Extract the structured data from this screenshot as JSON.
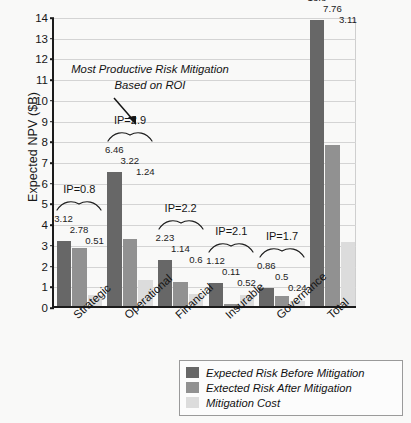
{
  "chart_data": {
    "type": "bar",
    "title": "",
    "xlabel": "",
    "ylabel": "Expected NPV ($B)",
    "ylim": [
      0,
      14
    ],
    "ytick_labels": [
      "0",
      "1",
      "2",
      "3",
      "4",
      "5",
      "6",
      "7",
      "8",
      "9",
      "10",
      "11",
      "12",
      "13",
      "14"
    ],
    "grid": true,
    "legend_position": "bottom-right",
    "categories": [
      "Strategic",
      "Operational",
      "Financial",
      "Insurable",
      "Governance",
      "Total"
    ],
    "series": [
      {
        "name": "Expected Risk Before Mitigation",
        "color": "#676767",
        "values": [
          3.12,
          6.46,
          2.23,
          1.12,
          0.86,
          13.8
        ],
        "labels": [
          "3.12",
          "6.46",
          "2.23",
          "1.12",
          "0.86",
          "13.8"
        ]
      },
      {
        "name": "Extected Risk After Mitigation",
        "color": "#919191",
        "values": [
          2.78,
          3.22,
          1.14,
          0.11,
          0.5,
          7.76
        ],
        "labels": [
          "2.78",
          "3.22",
          "1.14",
          "0.11",
          "0.5",
          "7.76"
        ]
      },
      {
        "name": "Mitigation Cost",
        "color": "#dcdcdc",
        "values": [
          0.51,
          1.24,
          0.6,
          0.52,
          0.24,
          3.11
        ],
        "labels": [
          "0.51",
          "1.24",
          "0.6",
          "0.52",
          "0.24",
          "3.11"
        ]
      }
    ],
    "annotations": {
      "ip_labels": [
        "IP=0.8",
        "IP=2.9",
        "IP=2.2",
        "IP=2.1",
        "IP=1.7",
        "IP=1.0"
      ],
      "callout_text": "Most Productive Risk Mitigation Based on ROI",
      "callout_target": "Operational"
    }
  }
}
